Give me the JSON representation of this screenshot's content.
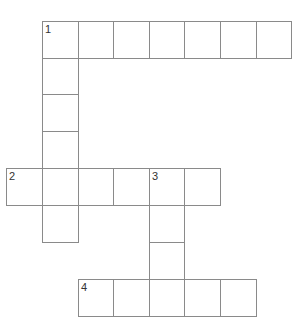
{
  "puzzle": {
    "grid": {
      "origin_x": 6,
      "origin_y": 21,
      "col_lines": [
        6,
        42,
        78,
        113,
        149,
        184,
        220,
        256,
        291
      ],
      "row_lines": [
        21,
        58,
        94,
        131,
        168,
        205,
        242,
        279,
        316
      ]
    },
    "cells": [
      {
        "r": 0,
        "c": 1,
        "num": "1"
      },
      {
        "r": 0,
        "c": 2
      },
      {
        "r": 0,
        "c": 3
      },
      {
        "r": 0,
        "c": 4
      },
      {
        "r": 0,
        "c": 5
      },
      {
        "r": 0,
        "c": 6
      },
      {
        "r": 0,
        "c": 7
      },
      {
        "r": 1,
        "c": 1
      },
      {
        "r": 2,
        "c": 1
      },
      {
        "r": 3,
        "c": 1
      },
      {
        "r": 4,
        "c": 0,
        "num": "2"
      },
      {
        "r": 4,
        "c": 1
      },
      {
        "r": 4,
        "c": 2
      },
      {
        "r": 4,
        "c": 3
      },
      {
        "r": 4,
        "c": 4,
        "num": "3"
      },
      {
        "r": 4,
        "c": 5
      },
      {
        "r": 5,
        "c": 1
      },
      {
        "r": 5,
        "c": 4
      },
      {
        "r": 6,
        "c": 4
      },
      {
        "r": 7,
        "c": 2,
        "num": "4"
      },
      {
        "r": 7,
        "c": 3
      },
      {
        "r": 7,
        "c": 4
      },
      {
        "r": 7,
        "c": 5
      },
      {
        "r": 7,
        "c": 6
      }
    ],
    "entries": [
      {
        "number": "1",
        "direction": "across",
        "length": 7
      },
      {
        "number": "1",
        "direction": "down",
        "length": 6
      },
      {
        "number": "2",
        "direction": "across",
        "length": 6
      },
      {
        "number": "3",
        "direction": "down",
        "length": 4
      },
      {
        "number": "4",
        "direction": "across",
        "length": 5
      }
    ]
  }
}
